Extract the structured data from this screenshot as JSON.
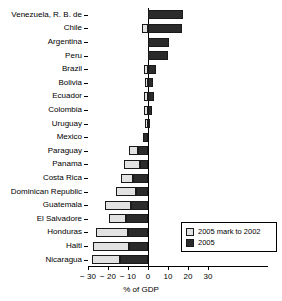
{
  "chart_data": {
    "type": "bar",
    "orientation": "horizontal",
    "stacked": true,
    "title": "",
    "xlabel": "% of GDP",
    "ylabel": "",
    "xlim": [
      -30,
      30
    ],
    "xticks": [
      -30,
      -20,
      -10,
      0,
      10,
      20,
      30
    ],
    "xticklabels": [
      "− 30",
      "− 20",
      "− 10",
      "0",
      "10",
      "20",
      "30"
    ],
    "grid": false,
    "legend_position": "bottom-right",
    "categories": [
      "Venezuela, R. B. de",
      "Chile",
      "Argentina",
      "Peru",
      "Brazil",
      "Bolivia",
      "Ecuador",
      "Colombia",
      "Uruguay",
      "Mexico",
      "Paraguay",
      "Panama",
      "Costa Rica",
      "Dominican Republic",
      "Guatemala",
      "El Salvadore",
      "Honduras",
      "Haiti",
      "Nicaragua"
    ],
    "series": [
      {
        "name": "2005",
        "color": "#2b2b2b",
        "values": [
          17.5,
          17.0,
          10.5,
          10.0,
          4.0,
          2.5,
          3.0,
          2.0,
          0.5,
          -2.5,
          -5.0,
          -4.0,
          -7.5,
          -6.0,
          -8.5,
          -11.0,
          -10.0,
          -9.5,
          -14.0
        ]
      },
      {
        "name": "2005 mark to 2002",
        "color": "#e2e2e2",
        "values": [
          0.0,
          -3.0,
          0.0,
          0.0,
          -2.0,
          -1.5,
          -2.0,
          -2.0,
          -1.5,
          0.0,
          -4.5,
          -8.0,
          -6.0,
          -10.0,
          -13.0,
          -8.5,
          -16.0,
          -18.0,
          -14.0
        ]
      }
    ],
    "legend": [
      {
        "label": "2005 mark to 2002",
        "color": "#e2e2e2"
      },
      {
        "label": "2005",
        "color": "#2b2b2b"
      }
    ]
  }
}
